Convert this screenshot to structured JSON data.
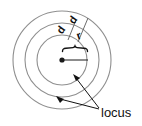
{
  "figure": {
    "type": "locus-diagram",
    "background_color": "#ffffff",
    "line_color": "#8c8c8c",
    "accent_color": "#111111",
    "center": {
      "x": 62,
      "y": 60
    },
    "circles": [
      {
        "name": "inner-circle",
        "radius": 25,
        "stroke": "#8f8f8f"
      },
      {
        "name": "middle-circle",
        "radius": 37,
        "stroke": "#8f8f8f"
      },
      {
        "name": "outer-circle",
        "radius": 49,
        "stroke": "#8f8f8f"
      }
    ],
    "center_point": {
      "label": "",
      "radius": 2.6
    },
    "radius_line": {
      "from_x": 62,
      "to_x": 88,
      "y": 60
    },
    "brace": {
      "label": "",
      "span_start_x": 62,
      "span_end_x": 88,
      "y": 50
    },
    "dimension_labels": [
      {
        "name": "d-label-left",
        "text": "d",
        "x": 64,
        "y": 32,
        "rotation": -55
      },
      {
        "name": "d-label-right",
        "text": "d",
        "x": 76,
        "y": 22,
        "rotation": -55
      },
      {
        "name": "r-label",
        "text": "r",
        "x": 79,
        "y": 38,
        "rotation": -20
      }
    ],
    "annotations": [
      {
        "name": "locus-callout",
        "text": "locus",
        "text_x": 101,
        "text_y": 113,
        "leaders": [
          {
            "name": "leader-to-middle-circle",
            "from_x": 99,
            "to_x": 74,
            "from_y": 108,
            "to_y": 76
          },
          {
            "name": "leader-to-outer-circle",
            "from_x": 99,
            "to_x": 58,
            "from_y": 109,
            "to_y": 98
          }
        ]
      }
    ]
  }
}
